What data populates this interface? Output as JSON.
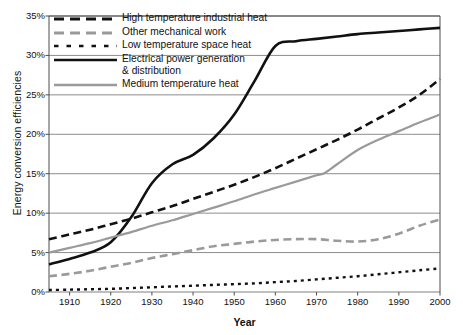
{
  "chart_data": {
    "type": "line",
    "title": "",
    "xlabel": "Year",
    "ylabel": "Energy conversion efficiencies",
    "xlim": [
      1905,
      2000
    ],
    "ylim": [
      0,
      35
    ],
    "grid": true,
    "y_tick_labels": [
      "0%",
      "5%",
      "10%",
      "15%",
      "20%",
      "25%",
      "30%",
      "35%"
    ],
    "y_ticks": [
      0,
      5,
      10,
      15,
      20,
      25,
      30,
      35
    ],
    "x_tick_labels": [
      "1910",
      "1920",
      "1930",
      "1940",
      "1950",
      "1960",
      "1970",
      "1980",
      "1990",
      "2000"
    ],
    "x_ticks": [
      1910,
      1920,
      1930,
      1940,
      1950,
      1960,
      1970,
      1980,
      1990,
      2000
    ],
    "legend_position": "upper-left",
    "series": [
      {
        "name": "High temperature industrial heat",
        "style": "dashed",
        "color": "#111111",
        "x": [
          1905,
          1910,
          1915,
          1920,
          1925,
          1930,
          1935,
          1940,
          1945,
          1950,
          1955,
          1960,
          1965,
          1970,
          1975,
          1980,
          1985,
          1990,
          1995,
          2000
        ],
        "values": [
          6.7,
          7.3,
          7.9,
          8.6,
          9.3,
          10.1,
          10.9,
          11.8,
          12.7,
          13.6,
          14.6,
          15.7,
          16.9,
          18.1,
          19.3,
          20.6,
          22.0,
          23.4,
          25.0,
          27.0
        ]
      },
      {
        "name": "Other mechanical work",
        "style": "dashed",
        "color": "#9a9a9a",
        "x": [
          1905,
          1910,
          1915,
          1920,
          1925,
          1930,
          1935,
          1940,
          1945,
          1950,
          1955,
          1960,
          1965,
          1970,
          1975,
          1980,
          1985,
          1990,
          1995,
          2000
        ],
        "values": [
          2.0,
          2.3,
          2.7,
          3.2,
          3.7,
          4.3,
          4.8,
          5.3,
          5.8,
          6.1,
          6.4,
          6.6,
          6.7,
          6.7,
          6.5,
          6.4,
          6.7,
          7.4,
          8.4,
          9.2
        ]
      },
      {
        "name": "Low temperature space heat",
        "style": "dotted",
        "color": "#111111",
        "x": [
          1905,
          1910,
          1915,
          1920,
          1925,
          1930,
          1935,
          1940,
          1945,
          1950,
          1955,
          1960,
          1965,
          1970,
          1975,
          1980,
          1985,
          1990,
          1995,
          2000
        ],
        "values": [
          0.25,
          0.3,
          0.35,
          0.4,
          0.5,
          0.6,
          0.7,
          0.8,
          0.9,
          1.0,
          1.1,
          1.25,
          1.4,
          1.6,
          1.8,
          2.0,
          2.25,
          2.5,
          2.75,
          3.0
        ]
      },
      {
        "name": "Electrical power generation & distribution",
        "style": "solid",
        "color": "#111111",
        "x": [
          1905,
          1910,
          1915,
          1920,
          1925,
          1930,
          1935,
          1940,
          1945,
          1950,
          1955,
          1960,
          1965,
          1970,
          1975,
          1980,
          1985,
          1990,
          1995,
          2000
        ],
        "values": [
          3.5,
          4.2,
          5.0,
          6.3,
          9.5,
          13.8,
          16.2,
          17.4,
          19.5,
          22.5,
          26.8,
          31.2,
          31.8,
          32.1,
          32.4,
          32.7,
          32.9,
          33.1,
          33.3,
          33.5
        ]
      },
      {
        "name": "Medium temperature heat",
        "style": "solid",
        "color": "#9a9a9a",
        "x": [
          1905,
          1910,
          1915,
          1920,
          1925,
          1930,
          1935,
          1940,
          1945,
          1950,
          1955,
          1960,
          1965,
          1970,
          1972,
          1975,
          1980,
          1985,
          1990,
          1995,
          2000
        ],
        "values": [
          5.0,
          5.6,
          6.2,
          6.9,
          7.6,
          8.4,
          9.1,
          9.9,
          10.7,
          11.5,
          12.4,
          13.2,
          14.0,
          14.8,
          15.1,
          16.2,
          18.0,
          19.3,
          20.4,
          21.5,
          22.5
        ]
      }
    ]
  },
  "legend": {
    "items": [
      {
        "label": "High temperature industrial heat",
        "style": "dashed",
        "color": "#111111"
      },
      {
        "label": "Other mechanical work",
        "style": "dashed",
        "color": "#9a9a9a"
      },
      {
        "label": "Low temperature space heat",
        "style": "dotted",
        "color": "#111111"
      },
      {
        "label": "Electrical power generation\n& distribution",
        "style": "solid",
        "color": "#111111"
      },
      {
        "label": "Medium temperature heat",
        "style": "solid",
        "color": "#9a9a9a"
      }
    ]
  },
  "axes": {
    "y_title": "Energy conversion efficiencies",
    "x_title": "Year"
  },
  "colors": {
    "dark": "#111111",
    "gray": "#9a9a9a",
    "grid": "#808080",
    "axis": "#4d4d4d",
    "background": "#ffffff"
  }
}
